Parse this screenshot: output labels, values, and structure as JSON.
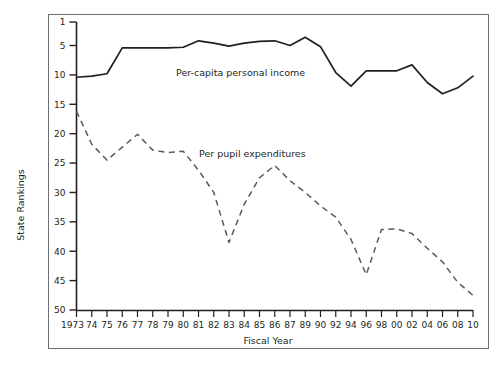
{
  "figure": {
    "frame_color": "#58595b",
    "background": "#ffffff"
  },
  "axes": {
    "ylabel": "State Rankings",
    "xlabel": "Fiscal Year"
  },
  "series_labels": {
    "income": "Per-capita personal income",
    "pupil": "Per pupil expenditures"
  },
  "caption": {
    "text": ""
  },
  "chart_data": {
    "type": "line",
    "title": "",
    "xlabel": "Fiscal Year",
    "ylabel": "State Rankings",
    "ylim": [
      1,
      50
    ],
    "y_inverted": true,
    "yticks": [
      1,
      5,
      10,
      15,
      20,
      25,
      30,
      35,
      40,
      45,
      50
    ],
    "grid": false,
    "legend": "inline-annotation",
    "categories": [
      "1973",
      "74",
      "75",
      "76",
      "77",
      "78",
      "79",
      "80",
      "81",
      "82",
      "83",
      "84",
      "85",
      "86",
      "87",
      "89",
      "90",
      "92",
      "94",
      "96",
      "98",
      "00",
      "02",
      "04",
      "06",
      "08",
      "10"
    ],
    "series": [
      {
        "name": "Per-capita personal income",
        "style": "solid",
        "color": "#231f20",
        "values": [
          10.4,
          10.2,
          9.8,
          5.4,
          5.4,
          5.4,
          5.4,
          5.3,
          4.2,
          4.6,
          5.1,
          4.6,
          4.3,
          4.2,
          5.0,
          3.6,
          5.2,
          9.6,
          11.9,
          9.3,
          9.3,
          9.3,
          8.3,
          11.3,
          13.2,
          12.2,
          10.2
        ]
      },
      {
        "name": "Per pupil expenditures",
        "style": "dashed",
        "color": "#58595b",
        "values": [
          16.2,
          21.8,
          24.5,
          22.3,
          20.1,
          22.8,
          23.2,
          23.0,
          26.2,
          30.0,
          38.5,
          32.0,
          27.5,
          25.4,
          28.0,
          30.0,
          32.3,
          34.2,
          38.0,
          44.0,
          36.3,
          36.2,
          37.0,
          39.5,
          41.8,
          45.3,
          47.5
        ]
      }
    ]
  }
}
